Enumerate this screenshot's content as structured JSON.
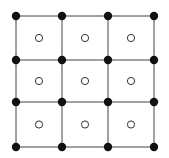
{
  "diagram": {
    "columns_x": [
      16,
      62,
      108,
      154
    ],
    "rows_y": [
      16,
      60,
      102,
      147
    ],
    "vertex_style": {
      "fill": "#111111",
      "radius": 4.2
    },
    "center_style": {
      "fill": "#ffffff",
      "stroke": "#333333",
      "radius": 3.6,
      "stroke_width": 1
    },
    "line_color": "#444444",
    "line_width": 1
  }
}
